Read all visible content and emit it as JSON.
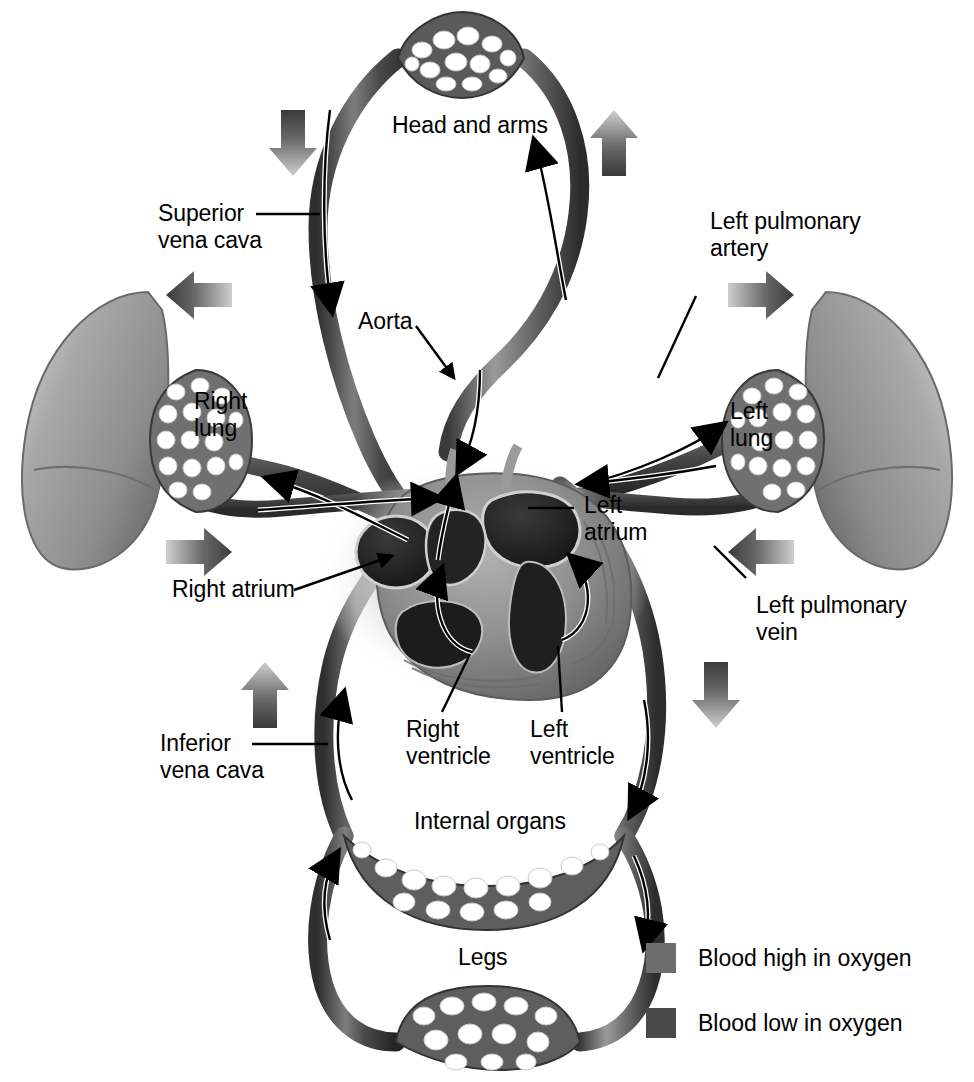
{
  "figure": {
    "background_color": "#ffffff",
    "colors": {
      "oxygen_high": "#6e6e6e",
      "oxygen_low": "#4a4a4a",
      "vessel_dark": "#3d3d3d",
      "vessel_light": "#8a8a8a",
      "outline": "#000000",
      "lung_fill": "#9a9a9a",
      "heart_muscle": "#8c8c8c",
      "chamber_dark": "#2a2a2a"
    }
  },
  "labels": {
    "head_and_arms": "Head and arms",
    "superior_vena_cava": "Superior\nvena cava",
    "aorta": "Aorta",
    "left_pulmonary_artery": "Left pulmonary\nartery",
    "right_lung": "Right\nlung",
    "left_lung": "Left\nlung",
    "right_atrium": "Right atrium",
    "left_atrium": "Left\natrium",
    "left_pulmonary_vein": "Left pulmonary\nvein",
    "right_ventricle": "Right\nventricle",
    "left_ventricle": "Left\nventricle",
    "inferior_vena_cava": "Inferior\nvena cava",
    "internal_organs": "Internal organs",
    "legs": "Legs"
  },
  "legend": {
    "items": [
      {
        "label": "Blood high in oxygen",
        "color": "#6e6e6e",
        "swatch_name": "oxygenated-blood-swatch"
      },
      {
        "label": "Blood low in oxygen",
        "color": "#4a4a4a",
        "swatch_name": "deoxygenated-blood-swatch"
      }
    ]
  },
  "flow_arrows": [
    {
      "name": "flow-arrow-top-left-down",
      "direction": "down",
      "x": 293,
      "y": 128
    },
    {
      "name": "flow-arrow-top-right-up",
      "direction": "up",
      "x": 614,
      "y": 128
    },
    {
      "name": "flow-arrow-left-out",
      "direction": "left",
      "x": 198,
      "y": 295
    },
    {
      "name": "flow-arrow-right-out",
      "direction": "right",
      "x": 762,
      "y": 295
    },
    {
      "name": "flow-arrow-left-in",
      "direction": "right",
      "x": 198,
      "y": 552
    },
    {
      "name": "flow-arrow-right-in",
      "direction": "left",
      "x": 762,
      "y": 552
    },
    {
      "name": "flow-arrow-bottom-left-up",
      "direction": "up",
      "x": 265,
      "y": 690
    },
    {
      "name": "flow-arrow-bottom-right-down",
      "direction": "down",
      "x": 716,
      "y": 690
    }
  ],
  "capillary_beds": [
    {
      "name": "head-and-arms-capillary-bed"
    },
    {
      "name": "right-lung-capillary-bed"
    },
    {
      "name": "left-lung-capillary-bed"
    },
    {
      "name": "internal-organs-capillary-bed"
    },
    {
      "name": "legs-capillary-bed"
    }
  ]
}
